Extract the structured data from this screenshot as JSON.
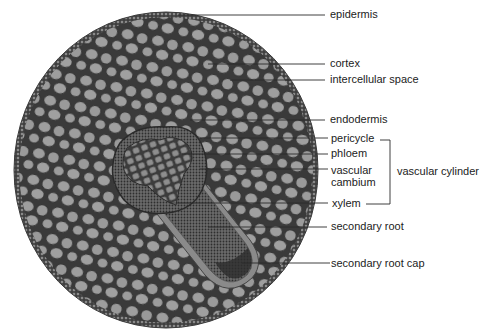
{
  "figure": {
    "colors": {
      "background": "#ffffff",
      "cell_fill": "#9c9c9c",
      "cell_wall": "#3a3a3a",
      "epidermis": "#7a7a7a",
      "stele_dense": "#4a4a4a",
      "leader_line": "#2a2a2a",
      "text": "#1c1c1c"
    }
  },
  "labels": {
    "epidermis": "epidermis",
    "cortex": "cortex",
    "intercellular_space": "intercellular space",
    "endodermis": "endodermis",
    "pericycle": "pericycle",
    "phloem": "phloem",
    "vascular_cambium_line1": "vascular",
    "vascular_cambium_line2": "cambium",
    "xylem": "xylem",
    "vascular_cylinder": "vascular cylinder",
    "secondary_root": "secondary root",
    "secondary_root_cap": "secondary root cap"
  },
  "groupings": {
    "vascular_cylinder_members": [
      "pericycle",
      "phloem",
      "vascular cambium",
      "xylem"
    ]
  }
}
